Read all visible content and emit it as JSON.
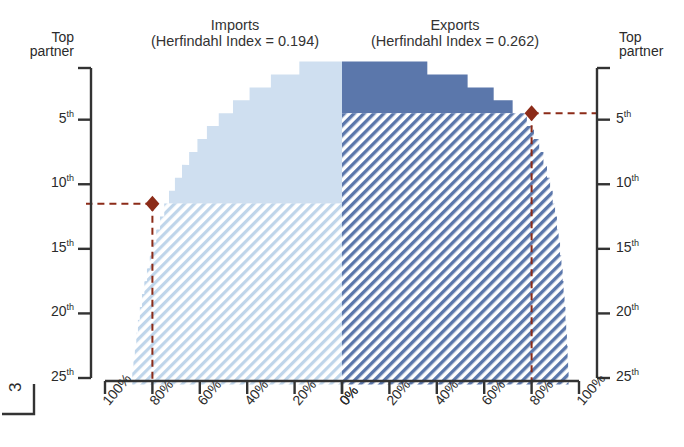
{
  "page": {
    "number": "3"
  },
  "panels": {
    "imports": {
      "name": "Imports",
      "title_line1": "Imports",
      "title_line2": "(Herfindahl Index = 0.194)",
      "herfindahl_index": 0.194
    },
    "exports": {
      "name": "Exports",
      "title_line1": "Exports",
      "title_line2": "(Herfindahl Index = 0.262)",
      "herfindahl_index": 0.262
    }
  },
  "axes": {
    "y_title": "Top partner",
    "y_title_line1": "Top",
    "y_title_line2": "partner",
    "y_ticks": [
      {
        "label": "5",
        "suffix": "th",
        "rank": 5
      },
      {
        "label": "10",
        "suffix": "th",
        "rank": 10
      },
      {
        "label": "15",
        "suffix": "th",
        "rank": 15
      },
      {
        "label": "20",
        "suffix": "th",
        "rank": 20
      },
      {
        "label": "25",
        "suffix": "th",
        "rank": 25
      }
    ],
    "x_ticks_left": [
      "100%",
      "80%",
      "60%",
      "40%",
      "20%",
      "0%"
    ],
    "x_ticks_right": [
      "0%",
      "20%",
      "40%",
      "60%",
      "80%",
      "100%"
    ]
  },
  "colors": {
    "imports_fill": "#cfdff0",
    "imports_hatch": "#bfd5ea",
    "exports_fill": "#5b77ab",
    "exports_hatch": "#6d86b5",
    "marker": "#8c2b18",
    "axis": "#333333"
  },
  "chart_data": {
    "type": "area",
    "xlabel": "Cumulative share of trade",
    "ylabel": "Top partner rank",
    "ylim": [
      1,
      25
    ],
    "xlim": [
      0,
      100
    ],
    "grid": false,
    "legend": "none",
    "orientation": "back-to-back horizontal",
    "series": [
      {
        "name": "Imports",
        "side": "left",
        "herfindahl_index": 0.194,
        "fill": "#cfdff0",
        "ranks": [
          1,
          2,
          3,
          4,
          5,
          6,
          7,
          8,
          9,
          10,
          11,
          12,
          13,
          14,
          15,
          16,
          17,
          18,
          19,
          20,
          21,
          22,
          23,
          24,
          25
        ],
        "cumulative_share_pct": [
          18,
          30,
          39,
          46,
          52,
          57,
          61,
          64.5,
          67.5,
          70.5,
          73,
          75,
          76.8,
          78.4,
          79.8,
          81.1,
          82.3,
          83.4,
          84.4,
          85.3,
          86.1,
          86.8,
          87.4,
          88.0,
          88.5
        ]
      },
      {
        "name": "Exports",
        "side": "right",
        "herfindahl_index": 0.262,
        "fill": "#5b77ab",
        "ranks": [
          1,
          2,
          3,
          4,
          5,
          6,
          7,
          8,
          9,
          10,
          11,
          12,
          13,
          14,
          15,
          16,
          17,
          18,
          19,
          20,
          21,
          22,
          23,
          24,
          25
        ],
        "cumulative_share_pct": [
          36,
          53,
          64,
          72,
          78,
          81,
          83.2,
          85.0,
          86.5,
          87.8,
          88.9,
          89.9,
          90.7,
          91.4,
          92.0,
          92.6,
          93.1,
          93.5,
          93.9,
          94.3,
          94.6,
          94.9,
          95.2,
          95.4,
          95.6
        ]
      }
    ],
    "annotations": [
      {
        "name": "imports-threshold-marker",
        "series": "Imports",
        "rank": 11,
        "cumulative_share_pct": 80,
        "marker": "diamond",
        "color": "#8c2b18",
        "guide": "dashed"
      },
      {
        "name": "exports-threshold-marker",
        "series": "Exports",
        "rank": 4,
        "cumulative_share_pct": 80,
        "marker": "diamond",
        "color": "#8c2b18",
        "guide": "dashed"
      }
    ]
  }
}
